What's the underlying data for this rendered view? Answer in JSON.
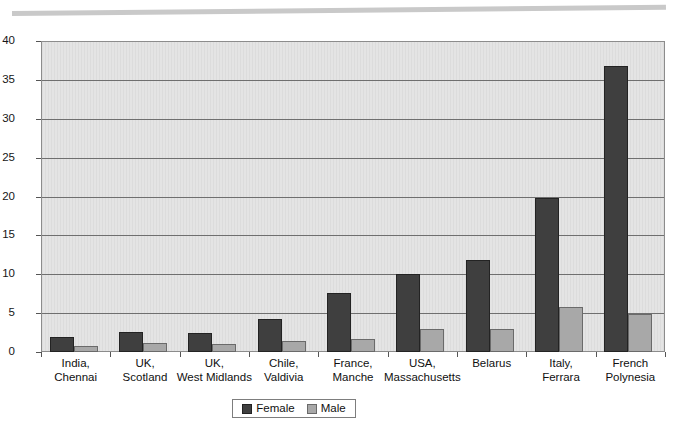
{
  "chart_data": {
    "type": "bar",
    "title": "",
    "xlabel": "",
    "ylabel": "",
    "ylim": [
      0,
      40
    ],
    "yticks": [
      0,
      5,
      10,
      15,
      20,
      25,
      30,
      35,
      40
    ],
    "grid": true,
    "legend_position": "bottom",
    "categories": [
      "India,\nChennai",
      "UK,\nScotland",
      "UK,\nWest Midlands",
      "Chile,\nValdivia",
      "France,\nManche",
      "USA,\nMassachusetts",
      "Belarus",
      "Italy,\nFerrara",
      "French\nPolynesia"
    ],
    "category_lines": [
      [
        "India,",
        "Chennai"
      ],
      [
        "UK,",
        "Scotland"
      ],
      [
        "UK,",
        "West Midlands"
      ],
      [
        "Chile,",
        "Valdivia"
      ],
      [
        "France,",
        "Manche"
      ],
      [
        "USA,",
        "Massachusetts"
      ],
      [
        "Belarus",
        ""
      ],
      [
        "Italy,",
        "Ferrara"
      ],
      [
        "French",
        "Polynesia"
      ]
    ],
    "series": [
      {
        "name": "Female",
        "color": "#3f3f3f",
        "values": [
          1.9,
          2.6,
          2.5,
          4.2,
          7.6,
          10.0,
          11.8,
          19.8,
          36.8
        ]
      },
      {
        "name": "Male",
        "color": "#a8a8a8",
        "values": [
          0.8,
          1.1,
          1.0,
          1.4,
          1.7,
          3.0,
          2.9,
          5.8,
          4.9
        ]
      }
    ]
  },
  "legend": {
    "items": [
      {
        "label": "Female",
        "swatch": "female"
      },
      {
        "label": "Male",
        "swatch": "male"
      }
    ]
  }
}
